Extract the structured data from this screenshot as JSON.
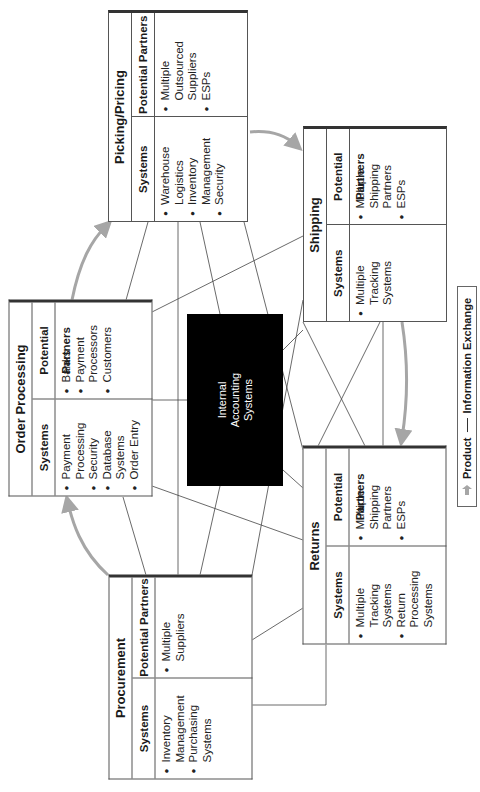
{
  "legend": {
    "product_label": "Product",
    "info_label": "Information Exchange",
    "product_icon": "gray-arrow-icon",
    "info_icon": "thin-line-icon"
  },
  "center": {
    "line1": "Internal",
    "line2": "Accounting",
    "line3": "Systems"
  },
  "column_headers": {
    "systems": "Systems",
    "partners": "Potential Partners"
  },
  "boxes": {
    "picking": {
      "title": "Picking/Pricing",
      "systems": [
        "Warehouse Logistics",
        "Inventory Management",
        "Security"
      ],
      "partners": [
        "Multiple Outsourced Suppliers",
        "ESPs"
      ]
    },
    "shipping": {
      "title": "Shipping",
      "systems": [
        "Multiple Tracking Systems"
      ],
      "partners": [
        "Multiple Shipping Partners",
        "ESPs"
      ]
    },
    "order": {
      "title": "Order Processing",
      "systems": [
        "Payment Processing",
        "Security",
        "Database Systems",
        "Order Entry"
      ],
      "partners": [
        "Banks",
        "Payment Processors",
        "Customers"
      ]
    },
    "returns": {
      "title": "Returns",
      "systems": [
        "Multiple Tracking Systems",
        "Return Processing Systems"
      ],
      "partners": [
        "Multiple Shipping Partners",
        "ESPs"
      ]
    },
    "procurement": {
      "title": "Procurement",
      "systems": [
        "Inventory Management",
        "Purchasing Systems"
      ],
      "partners": [
        "Multiple Suppliers"
      ]
    }
  },
  "colors": {
    "product_arrow": "#a6a6a6",
    "info_line": "#333333",
    "center_fill": "#000000"
  }
}
